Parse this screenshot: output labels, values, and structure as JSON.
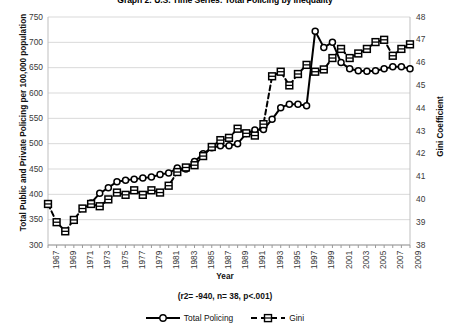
{
  "chart_data": {
    "type": "line",
    "title": "Graph 2: U.S. Time Series: Total Policing by Inequality",
    "xlabel": "Year",
    "ylabel": "Total Public and Private Policing per 100,000 population",
    "y2label": "Gini Coefficient",
    "ylim": [
      300,
      750
    ],
    "y2lim": [
      38,
      48
    ],
    "xlim": [
      1967,
      2009
    ],
    "grid": true,
    "legend_position": "bottom",
    "annotation": "(r2= -940, n= 38, p<.001)",
    "yticks": [
      300,
      350,
      400,
      450,
      500,
      550,
      600,
      650,
      700,
      750
    ],
    "y2ticks": [
      38,
      39,
      40,
      41,
      42,
      43,
      44,
      45,
      46,
      47,
      48
    ],
    "x": [
      1967,
      1968,
      1969,
      1970,
      1971,
      1972,
      1973,
      1974,
      1975,
      1976,
      1977,
      1978,
      1979,
      1980,
      1981,
      1982,
      1983,
      1984,
      1985,
      1986,
      1987,
      1988,
      1989,
      1990,
      1991,
      1992,
      1993,
      1994,
      1995,
      1996,
      1997,
      1998,
      1999,
      2000,
      2001,
      2002,
      2003,
      2004,
      2005,
      2006,
      2007,
      2008,
      2009
    ],
    "xtick_labels": [
      "1967",
      "1969",
      "1971",
      "1973",
      "1975",
      "1977",
      "1979",
      "1981",
      "1983",
      "1985",
      "1987",
      "1989",
      "1991",
      "1993",
      "1995",
      "1997",
      "1999",
      "2001",
      "2003",
      "2005",
      "2007",
      "2009"
    ],
    "series": [
      {
        "name": "Total Policing",
        "axis": "left",
        "marker": "circle",
        "line_style": "solid",
        "color": "#000000",
        "values": [
          null,
          null,
          null,
          null,
          null,
          383,
          402,
          413,
          425,
          428,
          430,
          432,
          434,
          439,
          442,
          452,
          450,
          465,
          480,
          492,
          496,
          496,
          500,
          520,
          527,
          528,
          548,
          571,
          578,
          578,
          575,
          722,
          690,
          700,
          660,
          648,
          644,
          643,
          644,
          648,
          652,
          652,
          648
        ]
      },
      {
        "name": "Gini",
        "axis": "right",
        "marker": "square",
        "line_style": "dashed",
        "color": "#000000",
        "values": [
          39.8,
          39.0,
          38.6,
          39.1,
          39.6,
          39.8,
          39.7,
          40.0,
          40.3,
          40.2,
          40.4,
          40.2,
          40.4,
          40.3,
          40.6,
          41.2,
          41.4,
          41.5,
          41.9,
          42.3,
          42.6,
          42.7,
          43.1,
          42.9,
          42.8,
          43.3,
          45.4,
          45.6,
          45.0,
          45.5,
          45.9,
          45.6,
          45.7,
          46.2,
          46.6,
          46.2,
          46.4,
          46.6,
          46.9,
          47.0,
          46.3,
          46.6,
          46.8
        ]
      }
    ]
  },
  "legend": {
    "items": [
      {
        "label": "Total Policing"
      },
      {
        "label": "Gini"
      }
    ]
  }
}
